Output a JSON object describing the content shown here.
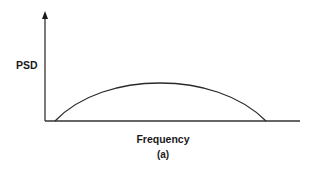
{
  "figure": {
    "y_axis_label": "PSD",
    "x_axis_label": "Frequency",
    "caption": "(a)",
    "line_color": "#2a2a2a",
    "background": "#ffffff"
  },
  "diagram": {
    "type": "power-spectral-density-sketch",
    "axes": {
      "origin": [
        45,
        121
      ],
      "y_axis_top": [
        45,
        12
      ],
      "x_axis_end": [
        300,
        121
      ],
      "y_axis_arrow": true,
      "x_axis_arrow": false
    },
    "curve": {
      "shape": "arch",
      "start": [
        55,
        121
      ],
      "peak": [
        160,
        83
      ],
      "end": [
        266,
        121
      ]
    }
  }
}
